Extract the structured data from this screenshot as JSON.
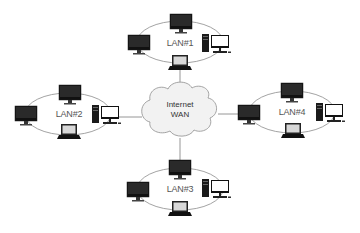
{
  "diagram": {
    "title": "",
    "colors": {
      "line": "#888888",
      "ellipse": "#8c8c8c",
      "cloud_fill": "#f2f2f2",
      "cloud_stroke": "#999999",
      "device_dark": "#111111",
      "screen_light": "#ffffff"
    },
    "center": {
      "label_line1": "Internet",
      "label_line2": "WAN",
      "icon": "cloud-icon"
    },
    "lans": [
      {
        "id": "lan1",
        "label": "LAN#1",
        "devices": [
          "monitor-top",
          "monitor-left",
          "desktop-right",
          "laptop-bottom"
        ],
        "uplink_device": "laptop-bottom"
      },
      {
        "id": "lan2",
        "label": "LAN#2",
        "devices": [
          "monitor-top",
          "monitor-left",
          "desktop-right",
          "laptop-bottom"
        ],
        "uplink_device": "desktop-right"
      },
      {
        "id": "lan3",
        "label": "LAN#3",
        "devices": [
          "monitor-top",
          "monitor-left",
          "desktop-right",
          "laptop-bottom"
        ],
        "uplink_device": "monitor-top"
      },
      {
        "id": "lan4",
        "label": "LAN#4",
        "devices": [
          "monitor-top",
          "monitor-left",
          "desktop-right",
          "laptop-bottom"
        ],
        "uplink_device": "monitor-left"
      }
    ]
  }
}
